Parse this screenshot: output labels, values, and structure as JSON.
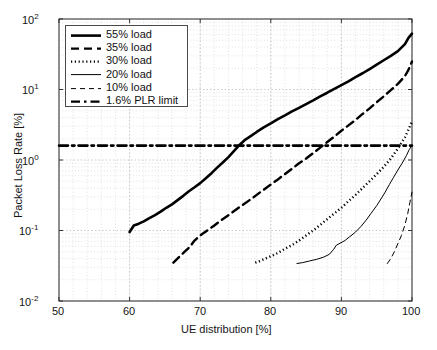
{
  "chart_data": {
    "type": "line",
    "title": "",
    "xlabel": "UE distribution [%]",
    "ylabel": "Packet Loss Rate [%]",
    "xlim": [
      50,
      100
    ],
    "ylim": [
      0.01,
      100
    ],
    "yscale": "log",
    "xscale": "linear",
    "xticks": [
      "50",
      "60",
      "70",
      "80",
      "90",
      "100"
    ],
    "xtick_values": [
      50,
      60,
      70,
      80,
      90,
      100
    ],
    "yticks": [
      "10-2",
      "10-1",
      "100",
      "101",
      "102"
    ],
    "ytick_values": [
      0.01,
      0.1,
      1,
      10,
      100
    ],
    "grid": true,
    "minor_grid": true,
    "legend_position": "upper left",
    "series": [
      {
        "name": "55% load",
        "style": "solid",
        "linewidth": 2.6,
        "color": "#000000",
        "x": [
          60.0,
          60.6,
          61.3,
          62.0,
          62.8,
          63.6,
          64.4,
          65.2,
          66.0,
          66.8,
          67.6,
          68.4,
          69.2,
          70.0,
          70.8,
          71.6,
          72.4,
          73.2,
          74.0,
          74.8,
          75.6,
          76.4,
          77.2,
          78.0,
          79.0,
          80.0,
          81.0,
          82.0,
          83.0,
          84.0,
          85.0,
          86.0,
          87.0,
          88.0,
          89.0,
          90.0,
          91.0,
          92.0,
          93.0,
          94.0,
          95.0,
          96.0,
          97.0,
          98.0,
          99.0,
          99.5,
          100.0
        ],
        "y": [
          0.095,
          0.118,
          0.125,
          0.135,
          0.15,
          0.165,
          0.185,
          0.21,
          0.235,
          0.27,
          0.31,
          0.36,
          0.41,
          0.47,
          0.55,
          0.65,
          0.78,
          0.92,
          1.1,
          1.35,
          1.65,
          1.95,
          2.2,
          2.5,
          2.9,
          3.3,
          3.8,
          4.3,
          4.9,
          5.5,
          6.2,
          7.0,
          8.0,
          9.0,
          10.2,
          11.5,
          13.0,
          15.0,
          17.0,
          19.5,
          22.5,
          26.0,
          30.0,
          35.0,
          44.0,
          54.0,
          62.0
        ]
      },
      {
        "name": "35% load",
        "style": "dashed",
        "linewidth": 2.4,
        "color": "#000000",
        "x": [
          66.2,
          67.0,
          67.8,
          68.5,
          69.2,
          70.0,
          71.0,
          72.0,
          73.0,
          74.0,
          75.0,
          76.0,
          77.0,
          78.0,
          79.0,
          80.0,
          81.0,
          82.0,
          83.0,
          84.0,
          85.0,
          86.0,
          87.0,
          88.0,
          89.0,
          90.0,
          91.0,
          92.0,
          93.0,
          94.0,
          95.0,
          96.0,
          97.0,
          98.0,
          99.0,
          99.5,
          100.0
        ],
        "y": [
          0.035,
          0.042,
          0.05,
          0.058,
          0.072,
          0.085,
          0.1,
          0.118,
          0.14,
          0.165,
          0.195,
          0.23,
          0.27,
          0.32,
          0.38,
          0.45,
          0.53,
          0.63,
          0.75,
          0.9,
          1.05,
          1.25,
          1.5,
          1.8,
          2.15,
          2.6,
          3.1,
          3.7,
          4.5,
          5.4,
          6.6,
          8.0,
          9.8,
          12.0,
          15.5,
          19.0,
          25.0
        ]
      },
      {
        "name": "30% load",
        "style": "dotted",
        "linewidth": 2.4,
        "color": "#000000",
        "x": [
          77.8,
          78.5,
          79.2,
          80.0,
          81.0,
          82.0,
          83.0,
          84.0,
          85.0,
          86.0,
          87.0,
          88.0,
          89.0,
          90.0,
          91.0,
          92.0,
          93.0,
          94.0,
          95.0,
          96.0,
          97.0,
          98.0,
          99.0,
          99.5,
          100.0
        ],
        "y": [
          0.035,
          0.037,
          0.04,
          0.043,
          0.048,
          0.055,
          0.062,
          0.072,
          0.085,
          0.1,
          0.12,
          0.145,
          0.175,
          0.21,
          0.26,
          0.32,
          0.4,
          0.5,
          0.63,
          0.8,
          1.05,
          1.45,
          2.1,
          2.7,
          3.5
        ]
      },
      {
        "name": "20% load",
        "style": "solid",
        "linewidth": 1.0,
        "color": "#000000",
        "x": [
          83.7,
          84.5,
          85.5,
          86.5,
          87.5,
          88.3,
          88.9,
          89.3,
          89.8,
          90.5,
          91.2,
          92.0,
          92.8,
          93.5,
          94.2,
          95.0,
          95.6,
          96.2,
          96.8,
          97.4,
          98.0,
          98.6,
          99.2,
          99.6,
          100.0
        ],
        "y": [
          0.034,
          0.035,
          0.037,
          0.039,
          0.042,
          0.046,
          0.054,
          0.062,
          0.066,
          0.072,
          0.082,
          0.095,
          0.115,
          0.14,
          0.175,
          0.225,
          0.28,
          0.35,
          0.45,
          0.57,
          0.72,
          0.9,
          1.15,
          1.4,
          1.6
        ]
      },
      {
        "name": "10% load",
        "style": "dashed",
        "linewidth": 1.0,
        "color": "#000000",
        "x": [
          96.5,
          97.0,
          97.5,
          98.0,
          98.5,
          99.0,
          99.4,
          99.7,
          100.0
        ],
        "y": [
          0.034,
          0.04,
          0.05,
          0.065,
          0.085,
          0.12,
          0.175,
          0.25,
          0.35
        ]
      },
      {
        "name": "1.6% PLR limit",
        "style": "dashdot",
        "linewidth": 2.6,
        "color": "#000000",
        "x": [
          50,
          100
        ],
        "y": [
          1.6,
          1.6
        ]
      }
    ],
    "legend": [
      {
        "label": "55% load",
        "style": "solid",
        "linewidth": 2.6
      },
      {
        "label": "35% load",
        "style": "dashed",
        "linewidth": 2.4
      },
      {
        "label": "30% load",
        "style": "dotted",
        "linewidth": 2.4
      },
      {
        "label": "20% load",
        "style": "solid",
        "linewidth": 1.0
      },
      {
        "label": "10% load",
        "style": "dashed",
        "linewidth": 1.0
      },
      {
        "label": "1.6% PLR limit",
        "style": "dashdot",
        "linewidth": 2.4
      }
    ]
  },
  "axes": {
    "x_title": "UE distribution [%]",
    "y_title": "Packet Loss Rate [%]",
    "x_tick_labels": [
      "50",
      "60",
      "70",
      "80",
      "90",
      "100"
    ],
    "y_tick_mantissa": [
      "10",
      "10",
      "10",
      "10",
      "10"
    ],
    "y_tick_exponent": [
      "2",
      "1",
      "0",
      "-1",
      "-2"
    ]
  },
  "colors": {
    "line": "#000000",
    "grid": "#bfbfbf",
    "minor_grid": "#d4d4d4",
    "axis": "#333333",
    "background": "#ffffff",
    "text": "#141414"
  }
}
